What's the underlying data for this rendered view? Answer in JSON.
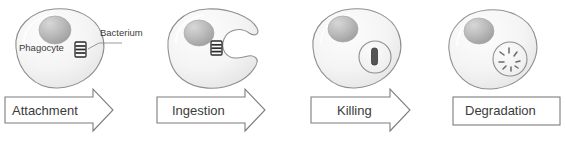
{
  "figure": {
    "background_color": "#ffffff",
    "outline_color": "#8c8c8c",
    "cell_fill_color": "#f4f4f4",
    "nucleus_color": "#b5b5b5",
    "bacterium_color": "#2b2b2b",
    "label_text_color": "#3b3b3b"
  },
  "annotations": {
    "phagocyte_label": "Phagocyte",
    "bacterium_label": "Bacterium"
  },
  "stages": [
    {
      "id": "attachment",
      "label": "Attachment",
      "shape": "arrow",
      "cell_state": "round-cell-with-bacterium-on-surface",
      "bacterium_state": "intact-rod-attached-outside"
    },
    {
      "id": "ingestion",
      "label": "Ingestion",
      "shape": "arrow",
      "cell_state": "c-shaped-cell-pseudopods-engulfing",
      "bacterium_state": "intact-rod-between-pseudopods"
    },
    {
      "id": "killing",
      "label": "Killing",
      "shape": "arrow",
      "cell_state": "round-cell-with-phagosome",
      "bacterium_state": "intact-rod-inside-phagosome"
    },
    {
      "id": "degradation",
      "label": "Degradation",
      "shape": "rectangle",
      "cell_state": "round-cell-with-phagolysosome",
      "bacterium_state": "fragmented-pieces-inside-vesicle"
    }
  ]
}
